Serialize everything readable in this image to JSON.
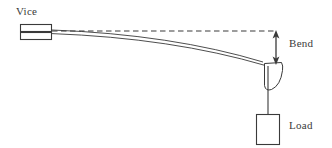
{
  "diagram": {
    "type": "schematic",
    "canvas": {
      "width": 332,
      "height": 148
    },
    "stroke_color": "#3a3a3a",
    "fill_color": "#ffffff",
    "background_color": "#ffffff",
    "labels": {
      "vice": "Vice",
      "bend": "Bend",
      "load": "Load"
    },
    "parts": {
      "vice": {
        "name": "Vice",
        "upper_jaw": {
          "x": 20,
          "y": 24,
          "width": 32,
          "height": 7
        },
        "lower_jaw": {
          "x": 20,
          "y": 32,
          "width": 32,
          "height": 7
        }
      },
      "reference_line": {
        "name": "undeflected reference line",
        "style": "dashed",
        "x1": 52,
        "y1": 31,
        "x2": 276,
        "y2": 31
      },
      "beam": {
        "name": "bent beam",
        "style": "double-line-curve",
        "start_x": 52,
        "start_y": 31,
        "end_x": 264,
        "end_y": 64,
        "control_x": 170,
        "control_y": 36,
        "thickness": 3
      },
      "hook": {
        "name": "hook at beam tip",
        "x": 264,
        "y": 64,
        "width": 18,
        "height": 26
      },
      "string": {
        "name": "suspension string",
        "x1": 268,
        "y1": 66,
        "x2": 268,
        "y2": 114
      },
      "load_box": {
        "name": "Load mass",
        "x": 256,
        "y": 114,
        "width": 24,
        "height": 31
      },
      "bend_arrow": {
        "name": "bend deflection double arrow",
        "x": 276,
        "y_top": 31,
        "y_bottom": 64,
        "heads": "both",
        "measured_quantity": "Bend"
      }
    }
  }
}
